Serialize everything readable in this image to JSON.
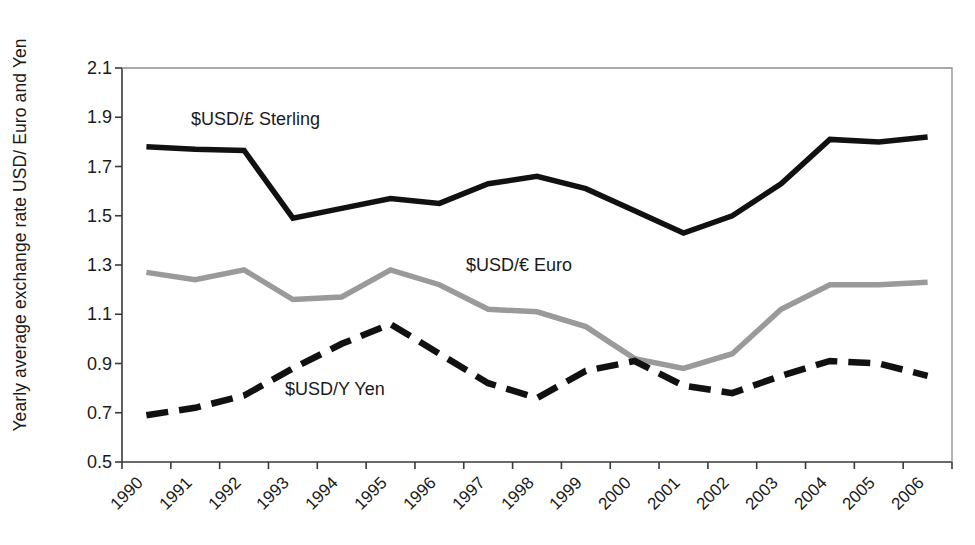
{
  "chart_data": {
    "type": "line",
    "title": "",
    "xlabel": "",
    "ylabel": "Yearly average exchange rate USD/ Euro and Yen",
    "ylim": [
      0.5,
      2.1
    ],
    "ytick_labels": [
      "2.1",
      "1.9",
      "1.7",
      "1.5",
      "1.3",
      "1.1",
      "0.9",
      "0.7",
      "0.5"
    ],
    "ytick_values": [
      2.1,
      1.9,
      1.7,
      1.5,
      1.3,
      1.1,
      0.9,
      0.7,
      0.5
    ],
    "grid": false,
    "legend_position": "inline-annotations",
    "categories": [
      "1990",
      "1991",
      "1992",
      "1993",
      "1994",
      "1995",
      "1996",
      "1997",
      "1998",
      "1999",
      "2000",
      "2001",
      "2002",
      "2003",
      "2004",
      "2005",
      "2006"
    ],
    "series": [
      {
        "name": "$USD/£ Sterling",
        "color": "#111111",
        "style": "solid",
        "values": [
          1.78,
          1.77,
          1.765,
          1.49,
          1.53,
          1.57,
          1.55,
          1.63,
          1.66,
          1.61,
          1.52,
          1.43,
          1.5,
          1.63,
          1.81,
          1.8,
          1.82
        ]
      },
      {
        "name": "$USD/€ Euro",
        "color": "#9a9a9a",
        "style": "solid",
        "values": [
          1.27,
          1.24,
          1.28,
          1.16,
          1.17,
          1.28,
          1.22,
          1.12,
          1.11,
          1.05,
          0.92,
          0.88,
          0.94,
          1.12,
          1.22,
          1.22,
          1.23
        ]
      },
      {
        "name": "$USD/Y Yen",
        "color": "#111111",
        "style": "dashed",
        "values": [
          0.69,
          0.72,
          0.77,
          0.88,
          0.98,
          1.06,
          0.94,
          0.82,
          0.76,
          0.87,
          0.91,
          0.81,
          0.78,
          0.85,
          0.91,
          0.9,
          0.85
        ]
      }
    ],
    "annotations": [
      {
        "text": "$USD/£ Sterling",
        "x_px": 191,
        "y_px": 110
      },
      {
        "text": "$USD/€ Euro",
        "x_px": 466,
        "y_px": 256
      },
      {
        "text": "$USD/Y Yen",
        "x_px": 285,
        "y_px": 380
      }
    ]
  },
  "axes": {
    "y_title": "Yearly average exchange rate USD/ Euro and Yen"
  }
}
